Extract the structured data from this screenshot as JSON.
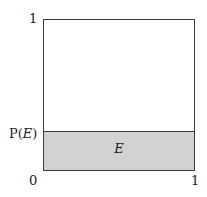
{
  "diagram": {
    "type": "unit-square-probability",
    "y_axis": {
      "top_label": "1",
      "bottom_label": "0",
      "marker_label_prefix": "P(",
      "marker_label_var": "E",
      "marker_label_suffix": ")",
      "marker_value": 0.25
    },
    "x_axis": {
      "right_label": "1"
    },
    "event": {
      "label": "E",
      "fill_color": "#d2d2d2"
    },
    "colors": {
      "border": "#3a3a3a",
      "background": "#ffffff"
    }
  }
}
